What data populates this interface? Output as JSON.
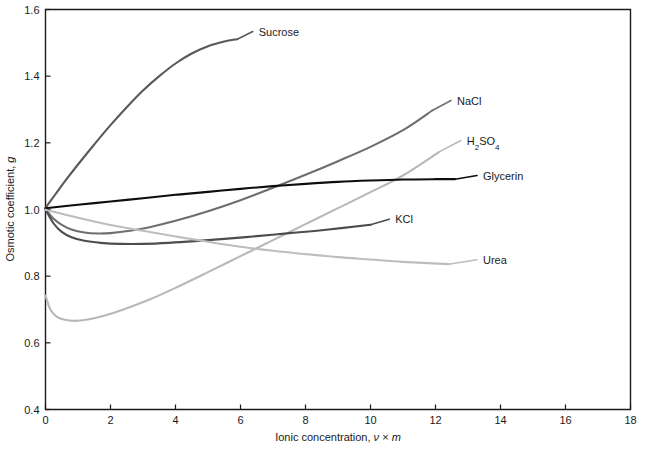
{
  "chart_data": {
    "type": "line",
    "title": "",
    "xlabel": "Ionic concentration, ν × m",
    "ylabel": "Osmotic coefficient, g",
    "xlim": [
      0,
      18
    ],
    "ylim": [
      0.4,
      1.6
    ],
    "xticks": [
      "0",
      "2",
      "4",
      "6",
      "8",
      "10",
      "12",
      "14",
      "16",
      "18"
    ],
    "yticks": [
      "0.4",
      "0.6",
      "0.8",
      "1.0",
      "1.2",
      "1.4",
      "1.6"
    ],
    "grid": false,
    "legend_position": "inline-end-of-curve",
    "series": [
      {
        "name": "Sucrose",
        "color": "#595959",
        "label": "Sucrose",
        "points": [
          [
            0.0,
            1.005
          ],
          [
            0.3,
            1.045
          ],
          [
            0.6,
            1.085
          ],
          [
            1.0,
            1.135
          ],
          [
            1.5,
            1.195
          ],
          [
            2.0,
            1.253
          ],
          [
            2.5,
            1.307
          ],
          [
            3.0,
            1.357
          ],
          [
            3.5,
            1.4
          ],
          [
            4.0,
            1.438
          ],
          [
            4.5,
            1.468
          ],
          [
            5.0,
            1.49
          ],
          [
            5.5,
            1.504
          ],
          [
            5.9,
            1.511
          ]
        ]
      },
      {
        "name": "NaCl",
        "color": "#6e6e6e",
        "label": "NaCl",
        "points": [
          [
            0.0,
            1.002
          ],
          [
            0.25,
            0.972
          ],
          [
            0.5,
            0.954
          ],
          [
            0.8,
            0.94
          ],
          [
            1.2,
            0.931
          ],
          [
            1.6,
            0.928
          ],
          [
            2.0,
            0.929
          ],
          [
            2.6,
            0.936
          ],
          [
            3.2,
            0.947
          ],
          [
            4.0,
            0.966
          ],
          [
            5.0,
            0.995
          ],
          [
            6.0,
            1.028
          ],
          [
            7.0,
            1.065
          ],
          [
            8.0,
            1.104
          ],
          [
            9.0,
            1.145
          ],
          [
            10.0,
            1.188
          ],
          [
            11.0,
            1.238
          ],
          [
            11.9,
            1.297
          ]
        ]
      },
      {
        "name": "H2SO4",
        "color": "#b8b8b8",
        "label": "H₂SO₄",
        "points": [
          [
            0.0,
            0.742
          ],
          [
            0.15,
            0.7
          ],
          [
            0.35,
            0.678
          ],
          [
            0.6,
            0.669
          ],
          [
            0.9,
            0.666
          ],
          [
            1.3,
            0.67
          ],
          [
            1.8,
            0.681
          ],
          [
            2.4,
            0.7
          ],
          [
            3.2,
            0.73
          ],
          [
            4.0,
            0.765
          ],
          [
            5.0,
            0.812
          ],
          [
            6.0,
            0.86
          ],
          [
            7.0,
            0.908
          ],
          [
            8.0,
            0.956
          ],
          [
            9.0,
            1.004
          ],
          [
            10.0,
            1.052
          ],
          [
            11.0,
            1.102
          ],
          [
            12.1,
            1.172
          ]
        ]
      },
      {
        "name": "Glycerin",
        "color": "#0d0d0d",
        "label": "Glycerin",
        "points": [
          [
            0.0,
            1.004
          ],
          [
            1.0,
            1.014
          ],
          [
            2.0,
            1.024
          ],
          [
            3.0,
            1.034
          ],
          [
            4.0,
            1.044
          ],
          [
            5.0,
            1.053
          ],
          [
            6.0,
            1.062
          ],
          [
            7.0,
            1.07
          ],
          [
            8.0,
            1.077
          ],
          [
            9.0,
            1.083
          ],
          [
            10.0,
            1.087
          ],
          [
            11.0,
            1.09
          ],
          [
            12.0,
            1.091
          ],
          [
            12.6,
            1.091
          ]
        ]
      },
      {
        "name": "KCl",
        "color": "#4d4d4d",
        "label": "KCl",
        "points": [
          [
            0.0,
            1.0
          ],
          [
            0.25,
            0.958
          ],
          [
            0.5,
            0.933
          ],
          [
            0.8,
            0.917
          ],
          [
            1.2,
            0.906
          ],
          [
            1.7,
            0.9
          ],
          [
            2.3,
            0.897
          ],
          [
            3.0,
            0.897
          ],
          [
            3.8,
            0.9
          ],
          [
            4.6,
            0.905
          ],
          [
            5.5,
            0.912
          ],
          [
            6.5,
            0.92
          ],
          [
            7.5,
            0.929
          ],
          [
            8.5,
            0.938
          ],
          [
            9.999,
            0.954
          ]
        ]
      },
      {
        "name": "Urea",
        "color": "#bdbdbd",
        "label": "Urea",
        "points": [
          [
            0.0,
            0.999
          ],
          [
            0.5,
            0.987
          ],
          [
            1.0,
            0.975
          ],
          [
            1.6,
            0.962
          ],
          [
            2.3,
            0.948
          ],
          [
            3.0,
            0.936
          ],
          [
            4.0,
            0.919
          ],
          [
            5.0,
            0.903
          ],
          [
            6.0,
            0.888
          ],
          [
            7.0,
            0.876
          ],
          [
            8.0,
            0.866
          ],
          [
            9.0,
            0.857
          ],
          [
            10.0,
            0.85
          ],
          [
            11.0,
            0.843
          ],
          [
            12.4,
            0.836
          ]
        ]
      }
    ],
    "annotations": [
      {
        "text": "Sucrose",
        "series": "Sucrose",
        "x": 6.5,
        "y": 1.525
      },
      {
        "text": "NaCl",
        "series": "NaCl",
        "x": 12.6,
        "y": 1.318
      },
      {
        "text": "H₂SO₄",
        "series": "H2SO4",
        "x": 12.9,
        "y": 1.198
      },
      {
        "text": "Glycerin",
        "series": "Glycerin",
        "x": 13.4,
        "y": 1.093
      },
      {
        "text": "KCl",
        "series": "KCl",
        "x": 10.7,
        "y": 0.962
      },
      {
        "text": "Urea",
        "series": "Urea",
        "x": 13.4,
        "y": 0.84
      }
    ]
  }
}
